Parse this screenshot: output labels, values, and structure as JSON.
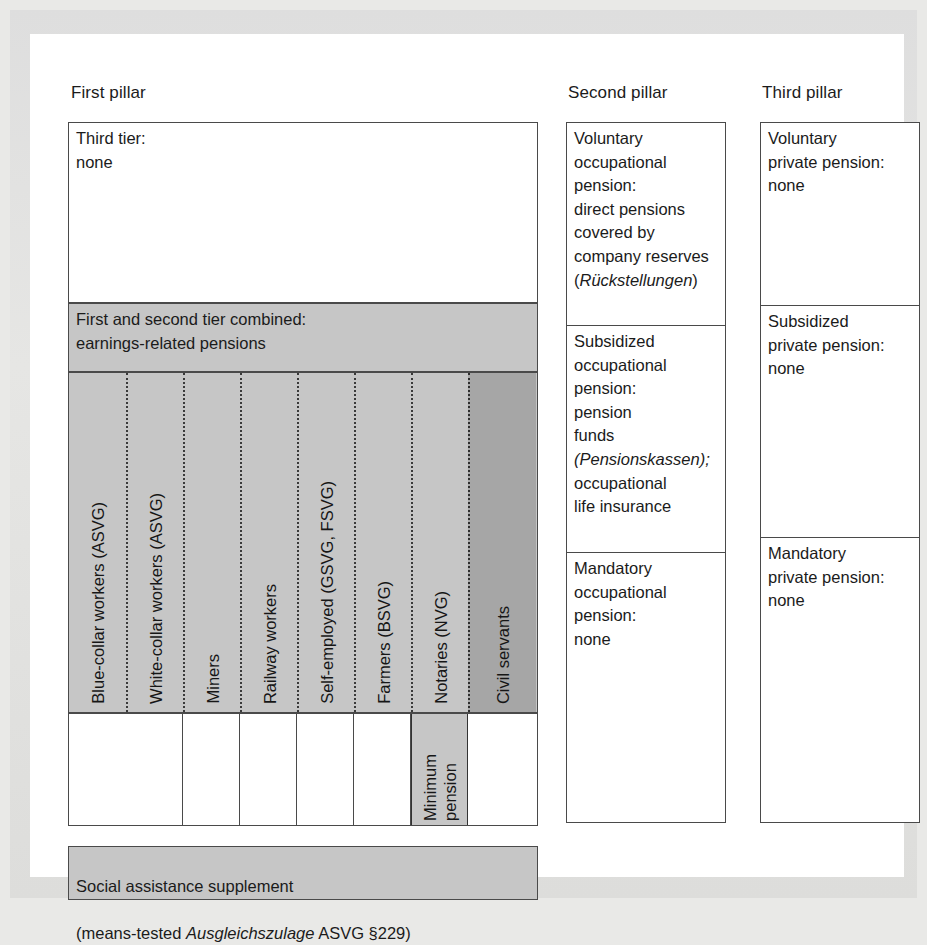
{
  "figure": {
    "headers": {
      "first": "First pillar",
      "second": "Second pillar",
      "third": "Third pillar"
    },
    "first_pillar": {
      "third_tier": "Third tier:\nnone",
      "combined_tier": "First and second tier combined:\nearnings-related pensions",
      "schemes": [
        {
          "label": "Blue-collar workers (ASVG)",
          "shade": "#c6c6c6",
          "divider": "none"
        },
        {
          "label": "White-collar workers (ASVG)",
          "shade": "#c6c6c6",
          "divider": "dotted"
        },
        {
          "label": "Miners",
          "shade": "#c6c6c6",
          "divider": "dotted"
        },
        {
          "label": "Railway workers",
          "shade": "#c6c6c6",
          "divider": "dotted"
        },
        {
          "label": "Self-employed (GSVG, FSVG)",
          "shade": "#c6c6c6",
          "divider": "dotted"
        },
        {
          "label": "Farmers (BSVG)",
          "shade": "#c6c6c6",
          "divider": "dotted"
        },
        {
          "label": "Notaries (NVG)",
          "shade": "#c6c6c6",
          "divider": "dotted"
        },
        {
          "label": "Civil servants",
          "shade": "#a6a6a6",
          "divider": "dotted"
        }
      ],
      "bottom_row": [
        {
          "label": "",
          "shade": "#ffffff"
        },
        {
          "label": "",
          "shade": "#ffffff"
        },
        {
          "label": "",
          "shade": "#ffffff"
        },
        {
          "label": "",
          "shade": "#ffffff"
        },
        {
          "label": "",
          "shade": "#ffffff"
        },
        {
          "label": "Minimum\npension",
          "shade": "#c6c6c6"
        },
        {
          "label": "",
          "shade": "#ffffff"
        }
      ],
      "social_assistance": {
        "line1": "Social assistance supplement",
        "line2_pre": "(means-tested ",
        "line2_italic": "Ausgleichszulage",
        "line2_post": " ASVG §229)"
      }
    },
    "second_pillar": {
      "cells": [
        {
          "pre": "Voluntary\noccupational\npension:\ndirect pensions\ncovered by\ncompany reserves\n(",
          "italic": "Rückstellungen",
          "post": ")"
        },
        {
          "pre": "Subsidized\noccupational\npension:\npension\nfunds\n",
          "italic": "(Pensionskassen);",
          "post": "\noccupational\nlife insurance"
        },
        {
          "pre": "Mandatory\noccupational\npension:\nnone",
          "italic": "",
          "post": ""
        }
      ]
    },
    "third_pillar": {
      "cells": [
        {
          "pre": "Voluntary\nprivate pension:\nnone",
          "italic": "",
          "post": ""
        },
        {
          "pre": "Subsidized\nprivate pension:\nnone",
          "italic": "",
          "post": ""
        },
        {
          "pre": "Mandatory\nprivate pension:\nnone",
          "italic": "",
          "post": ""
        }
      ]
    },
    "colors": {
      "light_gray": "#c6c6c6",
      "dark_gray": "#a6a6a6",
      "border": "#4a4a4a",
      "paper": "#ffffff"
    }
  }
}
